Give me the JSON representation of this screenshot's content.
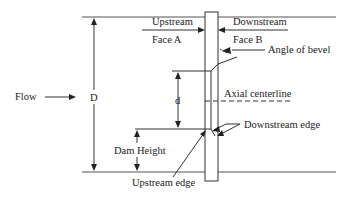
{
  "diagram": {
    "type": "orifice plate cross-section",
    "labels": {
      "upstream": "Upstream",
      "face_a": "Face A",
      "downstream": "Downstream",
      "face_b": "Face B",
      "angle_of_bevel": "Angle of bevel",
      "axial_centerline": "Axial centerline",
      "flow": "Flow",
      "pipe_diameter": "D",
      "bore_diameter": "d",
      "dam_height": "Dam Height",
      "downstream_edge": "Downstream edge",
      "upstream_edge": "Upstream edge"
    },
    "colors": {
      "line": "#333333",
      "pipe_wall": "#555555",
      "text": "#222222",
      "background": "#ffffff"
    }
  }
}
